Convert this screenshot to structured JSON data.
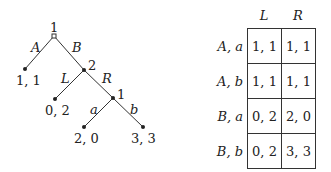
{
  "game_tree": {
    "nodes": [
      {
        "id": "root",
        "player": "1",
        "x": 54,
        "y": 36,
        "marker": "hollow"
      },
      {
        "id": "n2",
        "player": "2",
        "x": 84,
        "y": 70,
        "marker": "filled"
      },
      {
        "id": "n3",
        "player": "1",
        "x": 113,
        "y": 98,
        "marker": "filled"
      }
    ],
    "edges": [
      {
        "from": "root",
        "to": "leafA",
        "label": "A"
      },
      {
        "from": "root",
        "to": "n2",
        "label": "B"
      },
      {
        "from": "n2",
        "to": "leafL",
        "label": "L"
      },
      {
        "from": "n2",
        "to": "n3",
        "label": "R"
      },
      {
        "from": "n3",
        "to": "leafa",
        "label": "a"
      },
      {
        "from": "n3",
        "to": "leafb",
        "label": "b"
      }
    ],
    "leaves": [
      {
        "id": "leafA",
        "payoff": "1, 1"
      },
      {
        "id": "leafL",
        "payoff": "0, 2"
      },
      {
        "id": "leafa",
        "payoff": "2, 0"
      },
      {
        "id": "leafb",
        "payoff": "3, 3"
      }
    ],
    "player_labels": {
      "root": "1",
      "n2": "2",
      "n3": "1"
    },
    "edge_labels": {
      "A": "A",
      "B": "B",
      "L": "L",
      "R": "R",
      "a": "a",
      "b": "b"
    }
  },
  "payoff_matrix": {
    "columns": [
      "L",
      "R"
    ],
    "rows": [
      {
        "label": "A, a",
        "cells": [
          "1, 1",
          "1, 1"
        ]
      },
      {
        "label": "A, b",
        "cells": [
          "1, 1",
          "1, 1"
        ]
      },
      {
        "label": "B, a",
        "cells": [
          "0, 2",
          "2, 0"
        ]
      },
      {
        "label": "B, b",
        "cells": [
          "0, 2",
          "3, 3"
        ]
      }
    ]
  }
}
